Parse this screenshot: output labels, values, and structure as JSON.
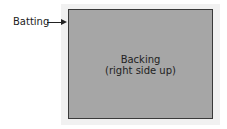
{
  "labels": {
    "batting": "Batting",
    "backing_line1": "Backing",
    "backing_line2": "(right side up)"
  },
  "colors": {
    "batting": "#f1f1f1",
    "backing": "#a6a6a6",
    "border": "#3a3a3a"
  }
}
